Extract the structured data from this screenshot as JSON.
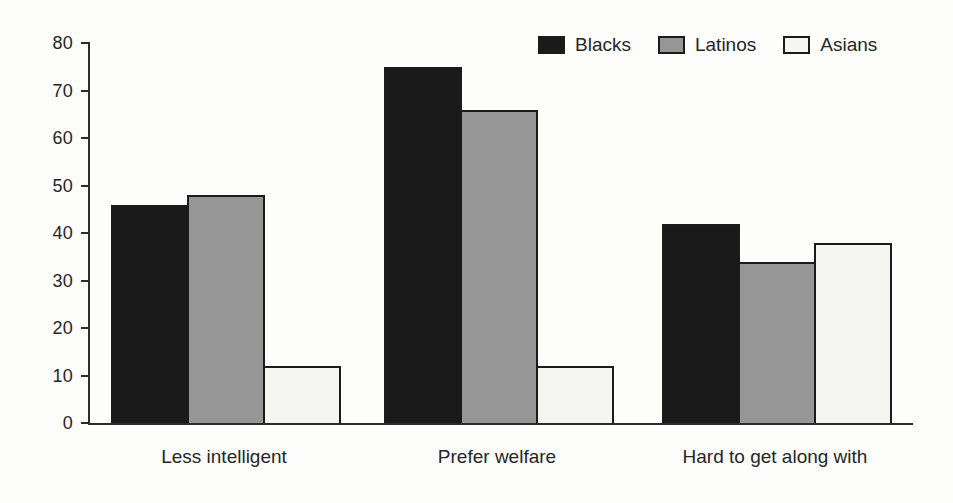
{
  "chart_data": {
    "type": "bar",
    "title": "",
    "xlabel": "",
    "ylabel": "",
    "categories": [
      "Less intelligent",
      "Prefer welfare",
      "Hard to get along with"
    ],
    "series": [
      {
        "name": "Blacks",
        "color": "#1a1a1a",
        "values": [
          46,
          75,
          42
        ]
      },
      {
        "name": "Latinos",
        "color": "#969696",
        "values": [
          48,
          66,
          34
        ]
      },
      {
        "name": "Asians",
        "color": "#f5f5f2",
        "values": [
          12,
          12,
          38
        ]
      }
    ],
    "ylim": [
      0,
      80
    ],
    "yticks": [
      0,
      10,
      20,
      30,
      40,
      50,
      60,
      70,
      80
    ],
    "grid": false,
    "legend_position": "top-right",
    "bar_border_color": "#1b1b1b",
    "axis_color": "#2b2b2b",
    "text_color": "#262626",
    "background_color": "#fdfdfb"
  }
}
